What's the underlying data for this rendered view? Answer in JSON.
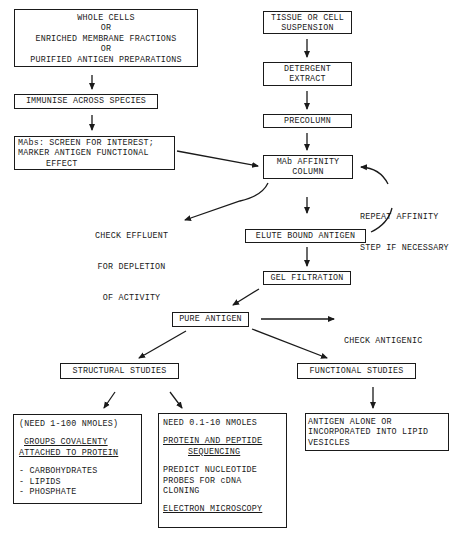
{
  "diagram": {
    "left_column": {
      "sources": {
        "lines": [
          "WHOLE CELLS",
          "OR",
          "ENRICHED MEMBRANE FRACTIONS",
          "OR",
          "PURIFIED ANTIGEN PREPARATIONS"
        ]
      },
      "immunise": {
        "label": "IMMUNISE ACROSS SPECIES"
      },
      "screen": {
        "lines": [
          "MAbs: SCREEN FOR INTEREST;",
          "MARKER ANTIGEN FUNCTIONAL",
          "EFFECT"
        ]
      }
    },
    "right_column": {
      "tissue": {
        "lines": [
          "TISSUE OR CELL",
          "SUSPENSION"
        ]
      },
      "detergent": {
        "lines": [
          "DETERGENT",
          "EXTRACT"
        ]
      },
      "precolumn": {
        "label": "PRECOLUMN"
      },
      "affinity": {
        "lines": [
          "MAb AFFINITY",
          "COLUMN"
        ]
      },
      "repeat_note": {
        "lines": [
          "REPEAT AFFINITY",
          "STEP IF NECESSARY"
        ]
      },
      "effluent_note": {
        "lines": [
          "CHECK EFFLUENT",
          "FOR DEPLETION",
          "OF ACTIVITY"
        ]
      },
      "elute": {
        "label": "ELUTE BOUND ANTIGEN"
      },
      "gel": {
        "label": "GEL FILTRATION"
      }
    },
    "pure_antigen": {
      "label": "PURE ANTIGEN"
    },
    "antigenic_note": {
      "lines": [
        "CHECK ANTIGENIC",
        "ACTIVITY"
      ]
    },
    "structural": {
      "label": "STRUCTURAL STUDIES"
    },
    "functional": {
      "label": "FUNCTIONAL STUDIES"
    },
    "structural_large": {
      "need": "(NEED 1-100 NMOLES)",
      "heading": [
        "GROUPS COVALENTY",
        "ATTACHED TO PROTEIN"
      ],
      "items": [
        "- CARBOHYDRATES",
        "- LIPIDS",
        "- PHOSPHATE"
      ]
    },
    "structural_small": {
      "need": "NEED 0.1-10 NMOLES",
      "heading": [
        "PROTEIN AND PEPTIDE",
        "SEQUENCING"
      ],
      "predict": [
        "PREDICT NUCLEOTIDE",
        "PROBES FOR cDNA",
        "CLONING"
      ],
      "microscopy": "ELECTRON MICROSCOPY"
    },
    "functional_detail": {
      "lines": [
        "ANTIGEN ALONE OR",
        "INCORPORATED INTO LIPID",
        "VESICLES"
      ]
    }
  }
}
